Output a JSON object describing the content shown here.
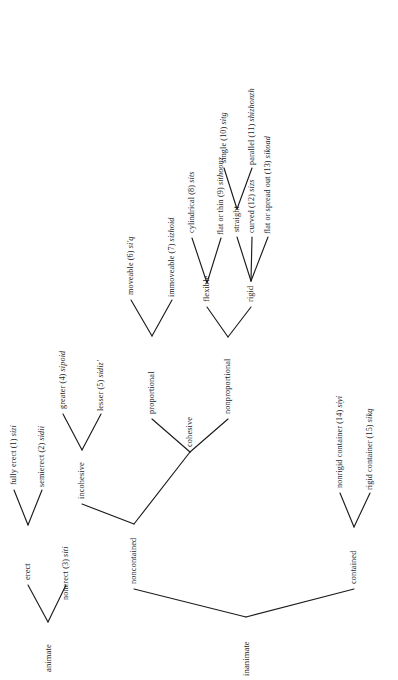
{
  "figure": {
    "type": "tree-diagram",
    "orientation": "rotated-90-ccw",
    "background_color": "#ffffff",
    "line_color": "#1c1c1c"
  },
  "nodes": {
    "animate": {
      "label": "animate"
    },
    "erect": {
      "label": "erect"
    },
    "nonerect": {
      "label": "nonerect (3) siti"
    },
    "fully_erect": {
      "label": "fully erect  (1) sizi"
    },
    "semierect": {
      "label": "semierect (2) sidii"
    },
    "inanimate": {
      "label": "inanimate"
    },
    "noncontained": {
      "label": "noncontained"
    },
    "contained": {
      "label": "contained"
    },
    "nonrigid_container": {
      "label": "nonrigid container (14) siyi"
    },
    "rigid_container": {
      "label": "rigid container (15) sikq"
    },
    "incohesive": {
      "label": "incohesive"
    },
    "cohesive": {
      "label": "cohesive"
    },
    "greater": {
      "label": "greater (4) sipoid"
    },
    "lesser": {
      "label": "lesser (5) sidiz'"
    },
    "proportional": {
      "label": "proportional"
    },
    "nonproportional": {
      "label": "nonproportional"
    },
    "moveable": {
      "label": "moveable (6) si'q"
    },
    "immoveable": {
      "label": "immoveable (7) sizhoid"
    },
    "flexible": {
      "label": "flexible"
    },
    "rigid": {
      "label": "rigid"
    },
    "cylindrical": {
      "label": "cylindrical (8) sits"
    },
    "flat_or_thin": {
      "label": "flat or thin (9) sithoonz"
    },
    "straight": {
      "label": "straight"
    },
    "curved": {
      "label": "curved (12) sizs"
    },
    "flat_or_spread_out": {
      "label": "flat or spread out (13) sikoad"
    },
    "single": {
      "label": "single (10) sitg"
    },
    "parallel": {
      "label": "parallel (11) shizhonzh"
    }
  }
}
